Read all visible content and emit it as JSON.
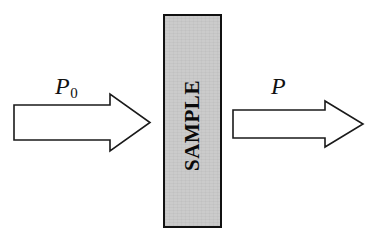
{
  "figure": {
    "background_color": "#ffffff",
    "width": 374,
    "height": 238
  },
  "sample": {
    "label": "SAMPLE",
    "fill_color": "#c9c9c9",
    "border_color": "#111111",
    "orientation": "vertical-rotated-90",
    "x": 163,
    "y": 14,
    "width": 59,
    "height": 214
  },
  "arrows": [
    {
      "name": "incident-beam-arrow",
      "direction": "right",
      "fill_color": "#ffffff",
      "stroke_color": "#1a1a1a",
      "tail_x": 14,
      "tip_x": 150,
      "shaft_top": 105,
      "shaft_bottom": 140,
      "head_top": 94,
      "head_bottom": 151,
      "head_start_x": 110
    },
    {
      "name": "transmitted-beam-arrow",
      "direction": "right",
      "fill_color": "#ffffff",
      "stroke_color": "#1a1a1a",
      "tail_x": 233,
      "tip_x": 363,
      "shaft_top": 110,
      "shaft_bottom": 138,
      "head_top": 101,
      "head_bottom": 147,
      "head_start_x": 325
    }
  ],
  "labels": {
    "incident": {
      "symbol": "P",
      "subscript": "0",
      "full_text": "P0",
      "meaning": "incident-radiant-power"
    },
    "transmitted": {
      "symbol": "P",
      "subscript": "",
      "full_text": "P",
      "meaning": "transmitted-radiant-power"
    }
  }
}
